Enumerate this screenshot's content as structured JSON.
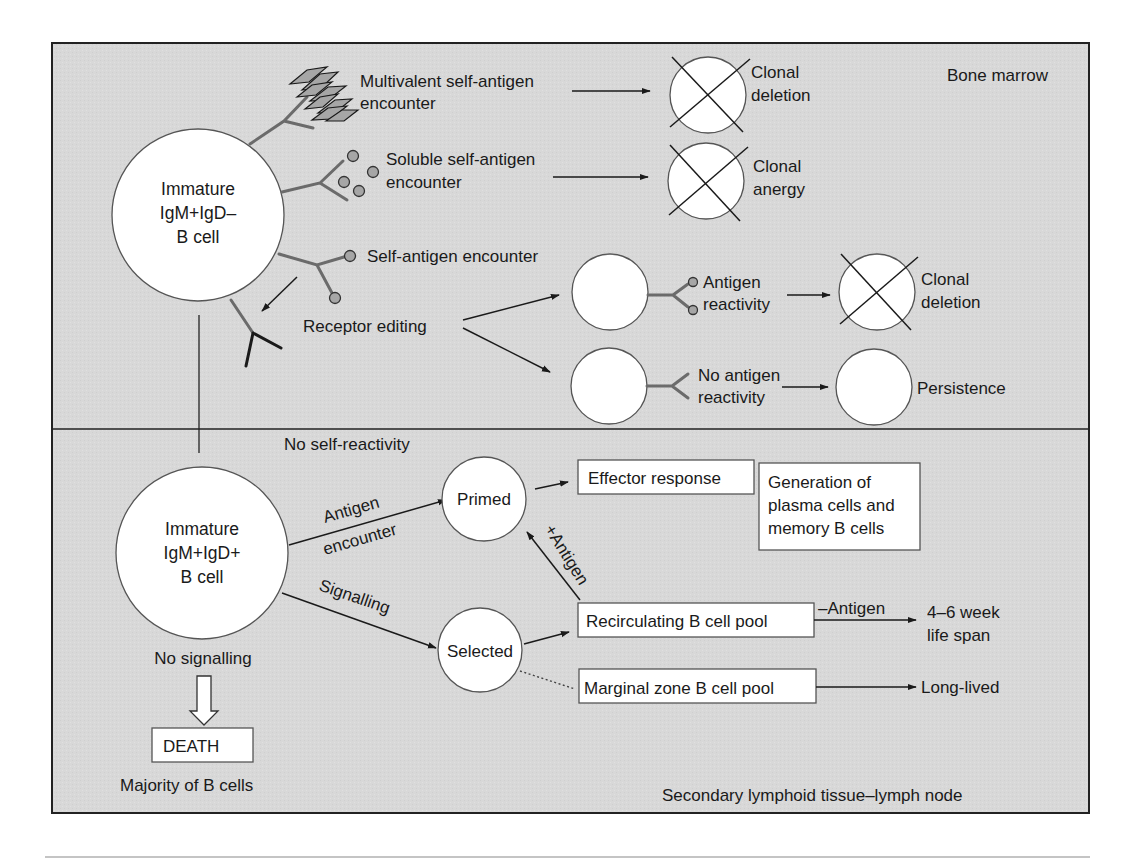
{
  "regions": {
    "bone_marrow": "Bone marrow",
    "lymph_node": "Secondary lymphoid tissue–lymph node"
  },
  "cells": {
    "immature_neg": [
      "Immature",
      "IgM+IgD–",
      "B cell"
    ],
    "immature_pos": [
      "Immature",
      "IgM+IgD+",
      "B cell"
    ],
    "primed": "Primed",
    "selected": "Selected"
  },
  "bone_marrow": {
    "multivalent": [
      "Multivalent self-antigen",
      "encounter"
    ],
    "soluble": [
      "Soluble self-antigen",
      "encounter"
    ],
    "self_antigen": "Self-antigen encounter",
    "receptor_editing": "Receptor editing",
    "antigen_reactivity": [
      "Antigen",
      "reactivity"
    ],
    "no_antigen_reactivity": [
      "No antigen",
      "reactivity"
    ],
    "outcomes": {
      "deletion_1": [
        "Clonal",
        "deletion"
      ],
      "anergy": [
        "Clonal",
        "anergy"
      ],
      "deletion_2": [
        "Clonal",
        "deletion"
      ],
      "persistence": "Persistence"
    }
  },
  "lymph_node": {
    "no_self_reactivity": "No self-reactivity",
    "antigen_encounter": [
      "Antigen",
      "encounter"
    ],
    "signalling": "Signalling",
    "no_signalling": "No signalling",
    "death": "DEATH",
    "majority": "Majority of B cells",
    "effector_response": "Effector response",
    "generation": [
      "Generation of",
      "plasma cells and",
      "memory B cells"
    ],
    "plus_antigen": "+Antigen",
    "recirculating_pool": "Recirculating B cell pool",
    "minus_antigen": "–Antigen",
    "life_span": [
      "4–6 week",
      "life span"
    ],
    "marginal_zone_pool": "Marginal zone B cell pool",
    "long_lived": "Long-lived"
  },
  "colors": {
    "panel_background": "#d8d8d8",
    "antigen_fill": "#a6a6a6",
    "receptor_stroke": "#6b6b6b"
  }
}
